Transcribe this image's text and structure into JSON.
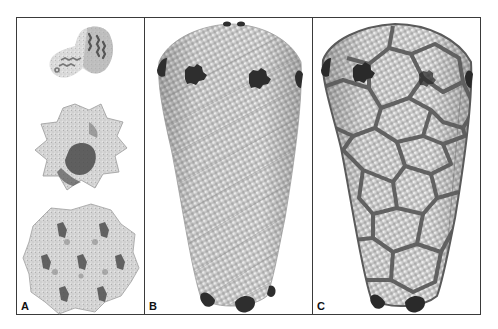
{
  "figure": {
    "panels": [
      {
        "id": "A",
        "label": "A",
        "description": "Protein subunit structures: monomer, hexamer, and hexagonal lattice",
        "elements": [
          "monomer",
          "hexamer",
          "hexagonal-lattice"
        ]
      },
      {
        "id": "B",
        "label": "B",
        "description": "Conical capsid model built from spheres with dark pentamer defects at the ends"
      },
      {
        "id": "C",
        "label": "C",
        "description": "Conical capsid model with overlaid hexagonal network outlining subunits"
      }
    ],
    "colors": {
      "frame": "#3a3a3a",
      "sphere_light": "#e6e6e6",
      "sphere_mid": "#bdbdbd",
      "sphere_shadow": "#8a8a8a",
      "pentamer_dark": "#2e2e2e",
      "network": "#5a5a5a"
    }
  }
}
